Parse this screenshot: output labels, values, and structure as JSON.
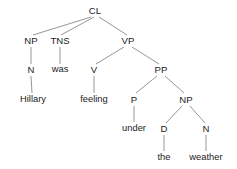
{
  "figure": {
    "type": "syntax-tree",
    "sentence": "Hillary was feeling under the weather",
    "background_color": "#ffffff",
    "edge_color": "#8a8a8a",
    "text_color": "#1b1b1b"
  },
  "nodes": [
    {
      "id": "cl",
      "label": "CL",
      "kind": "category",
      "x": 95,
      "y": 11
    },
    {
      "id": "np1",
      "label": "NP",
      "kind": "category",
      "x": 31,
      "y": 41
    },
    {
      "id": "tns",
      "label": "TNS",
      "kind": "category",
      "x": 60,
      "y": 41
    },
    {
      "id": "vp",
      "label": "VP",
      "kind": "category",
      "x": 128,
      "y": 41
    },
    {
      "id": "n1",
      "label": "N",
      "kind": "category",
      "x": 31,
      "y": 70
    },
    {
      "id": "was",
      "label": "was",
      "kind": "leaf",
      "x": 60,
      "y": 70
    },
    {
      "id": "v",
      "label": "V",
      "kind": "category",
      "x": 94,
      "y": 70
    },
    {
      "id": "pp",
      "label": "PP",
      "kind": "category",
      "x": 161,
      "y": 70
    },
    {
      "id": "hillary",
      "label": "Hillary",
      "kind": "leaf",
      "x": 33,
      "y": 100
    },
    {
      "id": "feeling",
      "label": "feeling",
      "kind": "leaf",
      "x": 94,
      "y": 100
    },
    {
      "id": "p",
      "label": "P",
      "kind": "category",
      "x": 134,
      "y": 100
    },
    {
      "id": "np2",
      "label": "NP",
      "kind": "category",
      "x": 186,
      "y": 100
    },
    {
      "id": "under",
      "label": "under",
      "kind": "leaf",
      "x": 134,
      "y": 129
    },
    {
      "id": "d",
      "label": "D",
      "kind": "category",
      "x": 164,
      "y": 129
    },
    {
      "id": "n2",
      "label": "N",
      "kind": "category",
      "x": 206,
      "y": 129
    },
    {
      "id": "the",
      "label": "the",
      "kind": "leaf",
      "x": 164,
      "y": 158
    },
    {
      "id": "weather",
      "label": "weather",
      "kind": "leaf",
      "x": 206,
      "y": 158
    }
  ],
  "edges": [
    {
      "from": "cl",
      "to": "np1",
      "x1": 91,
      "y1": 17,
      "x2": 33,
      "y2": 35
    },
    {
      "from": "cl",
      "to": "tns",
      "x1": 94,
      "y1": 17,
      "x2": 61,
      "y2": 35
    },
    {
      "from": "cl",
      "to": "vp",
      "x1": 99,
      "y1": 17,
      "x2": 127,
      "y2": 35
    },
    {
      "from": "np1",
      "to": "n1",
      "x1": 31,
      "y1": 47,
      "x2": 31,
      "y2": 64
    },
    {
      "from": "tns",
      "to": "was",
      "x1": 60,
      "y1": 47,
      "x2": 60,
      "y2": 64
    },
    {
      "from": "vp",
      "to": "v",
      "x1": 124,
      "y1": 47,
      "x2": 96,
      "y2": 64
    },
    {
      "from": "vp",
      "to": "pp",
      "x1": 132,
      "y1": 47,
      "x2": 159,
      "y2": 64
    },
    {
      "from": "n1",
      "to": "hillary",
      "x1": 31,
      "y1": 76,
      "x2": 32,
      "y2": 93
    },
    {
      "from": "v",
      "to": "feeling",
      "x1": 94,
      "y1": 76,
      "x2": 94,
      "y2": 93
    },
    {
      "from": "pp",
      "to": "p",
      "x1": 157,
      "y1": 76,
      "x2": 136,
      "y2": 93
    },
    {
      "from": "pp",
      "to": "np2",
      "x1": 165,
      "y1": 76,
      "x2": 184,
      "y2": 93
    },
    {
      "from": "p",
      "to": "under",
      "x1": 134,
      "y1": 106,
      "x2": 134,
      "y2": 122
    },
    {
      "from": "np2",
      "to": "d",
      "x1": 182,
      "y1": 106,
      "x2": 166,
      "y2": 123
    },
    {
      "from": "np2",
      "to": "n2",
      "x1": 190,
      "y1": 106,
      "x2": 205,
      "y2": 123
    },
    {
      "from": "d",
      "to": "the",
      "x1": 164,
      "y1": 135,
      "x2": 164,
      "y2": 151
    },
    {
      "from": "n2",
      "to": "weather",
      "x1": 206,
      "y1": 135,
      "x2": 206,
      "y2": 151
    }
  ]
}
